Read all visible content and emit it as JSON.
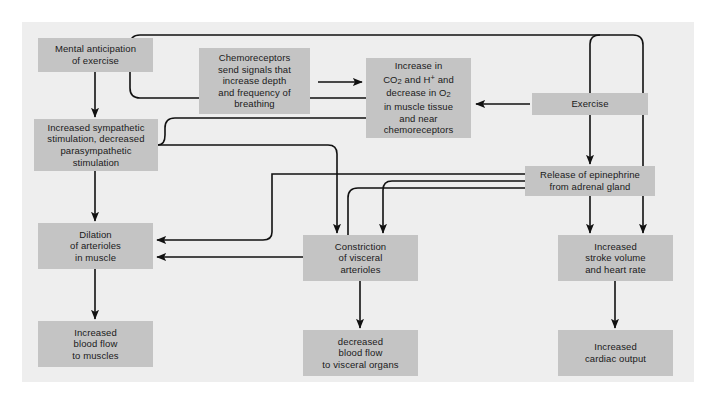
{
  "figure": {
    "type": "flowchart",
    "panel_background": "#eeeeee",
    "node_fill": "#c4c4c4",
    "connector_color": "#111111",
    "canvas": {
      "width": 716,
      "height": 400
    }
  },
  "nodes": [
    {
      "id": "mental-anticipation",
      "label": "Mental anticipation\nof exercise",
      "x": 38,
      "y": 38,
      "w": 115,
      "h": 34
    },
    {
      "id": "increased-sympathetic",
      "label": "Increased sympathetic\nstimulation, decreased\nparasympathetic\nstimulation",
      "x": 34,
      "y": 119,
      "w": 124,
      "h": 52
    },
    {
      "id": "dilation-arterioles",
      "label": "Dilation\nof arterioles\nin muscle",
      "x": 38,
      "y": 223,
      "w": 115,
      "h": 46
    },
    {
      "id": "increased-blood-flow-muscles",
      "label": "Increased\nblood flow\nto muscles",
      "x": 38,
      "y": 321,
      "w": 115,
      "h": 46
    },
    {
      "id": "chemoreceptors",
      "label": "Chemoreceptors\nsend signals that\nincrease depth\nand frequency of\nbreathing",
      "x": 199,
      "y": 48,
      "w": 111,
      "h": 66
    },
    {
      "id": "increase-co2",
      "label_html": "Increase in\nCO<sub>2</sub> and H<sup>+</sup> and\ndecrease in O<sub>2</sub>\nin muscle tissue\nand near\nchemoreceptors",
      "label": "Increase in CO2 and H+ and decrease in O2 in muscle tissue and near chemoreceptors",
      "x": 366,
      "y": 58,
      "w": 105,
      "h": 80
    },
    {
      "id": "constriction-visceral",
      "label": "Constriction\nof visceral\narterioles",
      "x": 303,
      "y": 235,
      "w": 115,
      "h": 46
    },
    {
      "id": "decreased-blood-flow-visceral",
      "label": "decreased\nblood flow\nto visceral organs",
      "x": 303,
      "y": 330,
      "w": 115,
      "h": 46
    },
    {
      "id": "exercise",
      "label": "Exercise",
      "x": 532,
      "y": 93,
      "w": 116,
      "h": 22
    },
    {
      "id": "release-epinephrine",
      "label": "Release of epinephrine\nfrom adrenal gland",
      "x": 525,
      "y": 166,
      "w": 130,
      "h": 30
    },
    {
      "id": "increased-stroke-volume",
      "label": "Increased\nstroke volume\nand heart rate",
      "x": 558,
      "y": 235,
      "w": 115,
      "h": 46
    },
    {
      "id": "increased-cardiac-output",
      "label": "Increased\ncardiac output",
      "x": 558,
      "y": 330,
      "w": 115,
      "h": 46
    }
  ],
  "edges": [
    {
      "id": "edge-mental-to-sympathetic",
      "from": "mental-anticipation",
      "to": "increased-sympathetic"
    },
    {
      "id": "edge-sympathetic-to-dilation",
      "from": "increased-sympathetic",
      "to": "dilation-arterioles"
    },
    {
      "id": "edge-dilation-to-bloodflow",
      "from": "dilation-arterioles",
      "to": "increased-blood-flow-muscles"
    },
    {
      "id": "edge-chemoreceptors-to-co2",
      "from": "chemoreceptors",
      "to": "increase-co2"
    },
    {
      "id": "edge-co2-to-chemoreceptors-loop",
      "from": "increase-co2",
      "to": "chemoreceptors"
    },
    {
      "id": "edge-co2-to-sympathetic",
      "from": "increase-co2",
      "to": "increased-sympathetic"
    },
    {
      "id": "edge-exercise-to-co2",
      "from": "exercise",
      "to": "increase-co2"
    },
    {
      "id": "edge-exercise-to-stroke-volume",
      "from": "exercise",
      "to": "increased-stroke-volume"
    },
    {
      "id": "edge-exercise-to-epinephrine",
      "from": "exercise",
      "to": "release-epinephrine"
    },
    {
      "id": "edge-epinephrine-to-stroke-volume",
      "from": "release-epinephrine",
      "to": "increased-stroke-volume"
    },
    {
      "id": "edge-epinephrine-to-dilation",
      "from": "release-epinephrine",
      "to": "dilation-arterioles"
    },
    {
      "id": "edge-sympathetic-to-constriction",
      "from": "increased-sympathetic",
      "to": "constriction-visceral"
    },
    {
      "id": "edge-epinephrine-to-constriction",
      "from": "release-epinephrine",
      "to": "constriction-visceral"
    },
    {
      "id": "edge-constriction-to-decreased-flow",
      "from": "constriction-visceral",
      "to": "decreased-blood-flow-visceral"
    },
    {
      "id": "edge-stroke-to-cardiac-output",
      "from": "increased-stroke-volume",
      "to": "increased-cardiac-output"
    }
  ]
}
